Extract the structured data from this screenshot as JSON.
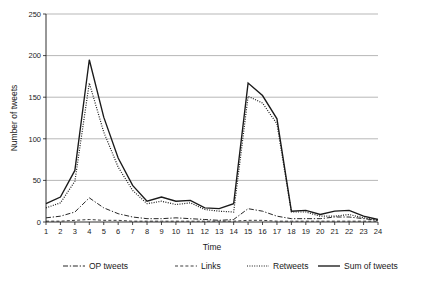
{
  "chart_data": {
    "type": "line",
    "title": "",
    "xlabel": "Time",
    "ylabel": "Number of tweets",
    "xlim": [
      1,
      24
    ],
    "ylim": [
      0,
      250
    ],
    "ytick_labels": [
      "0",
      "50",
      "100",
      "150",
      "200",
      "250"
    ],
    "yticks": [
      0,
      50,
      100,
      150,
      200,
      250
    ],
    "grid": "horizontal",
    "legend_position": "bottom",
    "x": [
      1,
      2,
      3,
      4,
      5,
      6,
      7,
      8,
      9,
      10,
      11,
      12,
      13,
      14,
      15,
      16,
      17,
      18,
      19,
      20,
      21,
      22,
      23,
      24
    ],
    "xtick_labels": [
      "1",
      "2",
      "3",
      "4",
      "5",
      "6",
      "7",
      "8",
      "9",
      "10",
      "11",
      "12",
      "13",
      "14",
      "15",
      "16",
      "17",
      "18",
      "19",
      "20",
      "21",
      "22",
      "23",
      "24"
    ],
    "series": [
      {
        "name": "OP tweets",
        "style": "dashdot",
        "values": [
          5,
          7,
          12,
          29,
          17,
          10,
          6,
          4,
          4,
          5,
          4,
          3,
          2,
          3,
          16,
          13,
          7,
          4,
          4,
          4,
          6,
          6,
          4,
          2
        ]
      },
      {
        "name": "Links",
        "style": "dashed",
        "values": [
          1,
          1,
          2,
          3,
          2,
          2,
          1,
          1,
          1,
          1,
          1,
          1,
          1,
          1,
          2,
          2,
          1,
          1,
          1,
          1,
          1,
          1,
          1,
          1
        ]
      },
      {
        "name": "Retweets",
        "style": "dotted",
        "values": [
          17,
          23,
          49,
          167,
          108,
          66,
          38,
          22,
          25,
          21,
          23,
          15,
          13,
          12,
          151,
          143,
          118,
          12,
          12,
          7,
          7,
          9,
          5,
          2
        ]
      },
      {
        "name": "Sum of tweets",
        "style": "solid",
        "values": [
          22,
          30,
          62,
          195,
          126,
          77,
          44,
          25,
          30,
          25,
          26,
          17,
          16,
          22,
          167,
          152,
          124,
          13,
          14,
          9,
          13,
          14,
          7,
          3
        ]
      }
    ]
  },
  "legend": {
    "items": [
      {
        "label": "OP tweets",
        "style": "dashdot"
      },
      {
        "label": "Links",
        "style": "dashed"
      },
      {
        "label": "Retweets",
        "style": "dotted"
      },
      {
        "label": "Sum of tweets",
        "style": "solid"
      }
    ]
  }
}
